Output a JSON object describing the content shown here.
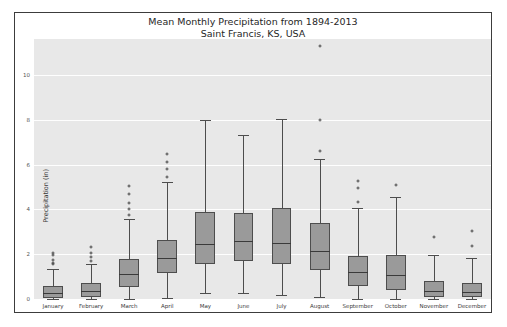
{
  "top_crumb": "",
  "chart_data": {
    "type": "box",
    "title": "Mean Monthly Precipitation from 1894-2013",
    "subtitle": "Saint Francis, KS, USA",
    "xlabel": "",
    "ylabel": "Precipitation (in)",
    "ylim": [
      0,
      11.6
    ],
    "yticks": [
      0,
      2,
      4,
      6,
      8,
      10
    ],
    "ytick_labels": [
      "0",
      "2",
      "4",
      "6",
      "8",
      "10"
    ],
    "grid": true,
    "grid_color": "#ffffff",
    "axes_bgcolor": "#e8e8e8",
    "box_facecolor": "#9a9a9a",
    "box_edgecolor": "#4d4d4d",
    "figure_edgecolor": "#3c3c3c",
    "categories": [
      "January",
      "February",
      "March",
      "April",
      "May",
      "June",
      "July",
      "August",
      "September",
      "October",
      "November",
      "December"
    ],
    "boxes": [
      {
        "label": "January",
        "whisker_low": 0.0,
        "q1": 0.05,
        "median": 0.25,
        "q3": 0.6,
        "whisker_high": 1.35,
        "fliers": [
          1.55,
          1.62,
          1.75,
          1.95,
          2.05
        ]
      },
      {
        "label": "February",
        "whisker_low": 0.0,
        "q1": 0.1,
        "median": 0.35,
        "q3": 0.72,
        "whisker_high": 1.55,
        "fliers": [
          1.7,
          1.88,
          2.05,
          2.3
        ]
      },
      {
        "label": "March",
        "whisker_low": 0.0,
        "q1": 0.55,
        "median": 1.1,
        "q3": 1.8,
        "whisker_high": 3.55,
        "fliers": [
          3.75,
          4.0,
          4.3,
          4.7,
          5.05
        ]
      },
      {
        "label": "April",
        "whisker_low": 0.05,
        "q1": 1.15,
        "median": 1.85,
        "q3": 2.65,
        "whisker_high": 5.2,
        "fliers": [
          5.45,
          5.8,
          6.1,
          6.45
        ]
      },
      {
        "label": "May",
        "whisker_low": 0.25,
        "q1": 1.55,
        "median": 2.45,
        "q3": 3.9,
        "whisker_high": 8.0,
        "fliers": []
      },
      {
        "label": "June",
        "whisker_low": 0.25,
        "q1": 1.7,
        "median": 2.6,
        "q3": 3.85,
        "whisker_high": 7.3,
        "fliers": []
      },
      {
        "label": "July",
        "whisker_low": 0.2,
        "q1": 1.55,
        "median": 2.5,
        "q3": 4.05,
        "whisker_high": 8.05,
        "fliers": []
      },
      {
        "label": "August",
        "whisker_low": 0.1,
        "q1": 1.3,
        "median": 2.15,
        "q3": 3.4,
        "whisker_high": 6.25,
        "fliers": [
          6.6,
          8.0,
          11.3
        ]
      },
      {
        "label": "September",
        "whisker_low": 0.0,
        "q1": 0.6,
        "median": 1.2,
        "q3": 1.9,
        "whisker_high": 4.05,
        "fliers": [
          4.35,
          4.95,
          5.25
        ]
      },
      {
        "label": "October",
        "whisker_low": 0.0,
        "q1": 0.4,
        "median": 1.05,
        "q3": 1.95,
        "whisker_high": 4.55,
        "fliers": [
          5.1
        ]
      },
      {
        "label": "November",
        "whisker_low": 0.0,
        "q1": 0.1,
        "median": 0.35,
        "q3": 0.8,
        "whisker_high": 1.95,
        "fliers": [
          2.75
        ]
      },
      {
        "label": "December",
        "whisker_low": 0.0,
        "q1": 0.08,
        "median": 0.3,
        "q3": 0.7,
        "whisker_high": 1.85,
        "fliers": [
          2.35,
          3.05
        ]
      }
    ]
  }
}
